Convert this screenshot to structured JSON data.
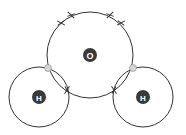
{
  "diagram": {
    "atoms": [
      {
        "symbol": "O",
        "cx": 90,
        "cy": 55,
        "shell_r": 43
      },
      {
        "symbol": "H",
        "cx": 39,
        "cy": 97,
        "shell_r": 30
      },
      {
        "symbol": "H",
        "cx": 143,
        "cy": 97,
        "shell_r": 30
      }
    ],
    "shared_dots": [
      {
        "x": 48,
        "y": 68
      },
      {
        "x": 133,
        "y": 68
      }
    ],
    "crosses": [
      {
        "x": 61,
        "y": 23
      },
      {
        "x": 71,
        "y": 15
      },
      {
        "x": 110,
        "y": 15
      },
      {
        "x": 121,
        "y": 23
      },
      {
        "x": 67,
        "y": 90
      },
      {
        "x": 114,
        "y": 90
      }
    ],
    "colors": {
      "shell": "#333333",
      "nucleus": "#3a3a3a",
      "nucleus_text": "#ffffff",
      "dot": "#cfcfcf"
    }
  }
}
